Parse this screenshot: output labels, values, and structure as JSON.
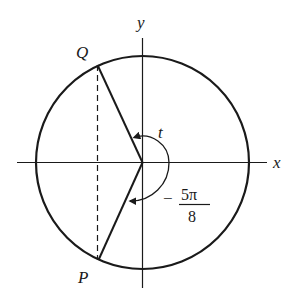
{
  "diagram": {
    "type": "unit-circle",
    "axes": {
      "x_label": "x",
      "y_label": "y"
    },
    "points": [
      {
        "name": "Q",
        "label": "Q"
      },
      {
        "name": "P",
        "label": "P"
      }
    ],
    "angles": [
      {
        "name": "t",
        "label": "t",
        "direction": "counterclockwise"
      },
      {
        "name": "neg-5pi-over-8",
        "sign": "−",
        "numerator": "5π",
        "denominator": "8",
        "direction": "clockwise"
      }
    ],
    "segments": [
      {
        "from": "origin",
        "to": "Q",
        "style": "solid"
      },
      {
        "from": "origin",
        "to": "P",
        "style": "solid"
      },
      {
        "from": "Q",
        "to": "P",
        "style": "dashed"
      }
    ],
    "colors": {
      "stroke": "#1a1a1a",
      "background": "#ffffff"
    }
  }
}
